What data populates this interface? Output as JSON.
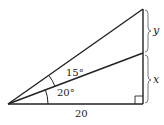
{
  "diagram": {
    "type": "right-triangle",
    "angles": {
      "lower": "20°",
      "upper": "15°"
    },
    "base_label": "20",
    "segments": {
      "lower": "x",
      "upper": "y"
    },
    "right_angle_marker": true,
    "stroke_color": "#222222"
  }
}
